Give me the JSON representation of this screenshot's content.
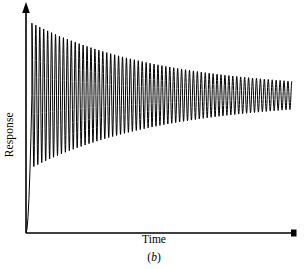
{
  "figure": {
    "caption_prefix": "(",
    "caption_letter": "b",
    "caption_suffix": ")",
    "background_color": "#ffffff",
    "ink_color": "#000000"
  },
  "chart_data": {
    "type": "line",
    "title": "",
    "subtitle": "",
    "xlabel": "Time",
    "ylabel": "Response",
    "annotation": "(b)",
    "grid": false,
    "legend": null,
    "legend_position": "none",
    "axis_style": {
      "x_axis_arrow": true,
      "y_axis_arrow": true,
      "ticks": false,
      "tick_labels": false,
      "spines": [
        "left",
        "bottom"
      ]
    },
    "xlim": [
      0,
      1
    ],
    "ylim": [
      0,
      1
    ],
    "x_unit_label": "Time",
    "y_unit_label": "Response",
    "series": [
      {
        "name": "response",
        "color": "#000000",
        "line_width": 1,
        "model": "damped_sinusoid",
        "steady_state": 0.62,
        "initial_overshoot_peak": 0.945,
        "initial_value": 0.0,
        "rise_x": 0.022,
        "damping_decay_constant": 2.05,
        "residual_amplitude": 0.022,
        "cycles": 67,
        "period_x": 0.0147,
        "x_start": 0.0,
        "x_end": 0.992,
        "points_per_cycle": 24
      }
    ]
  }
}
